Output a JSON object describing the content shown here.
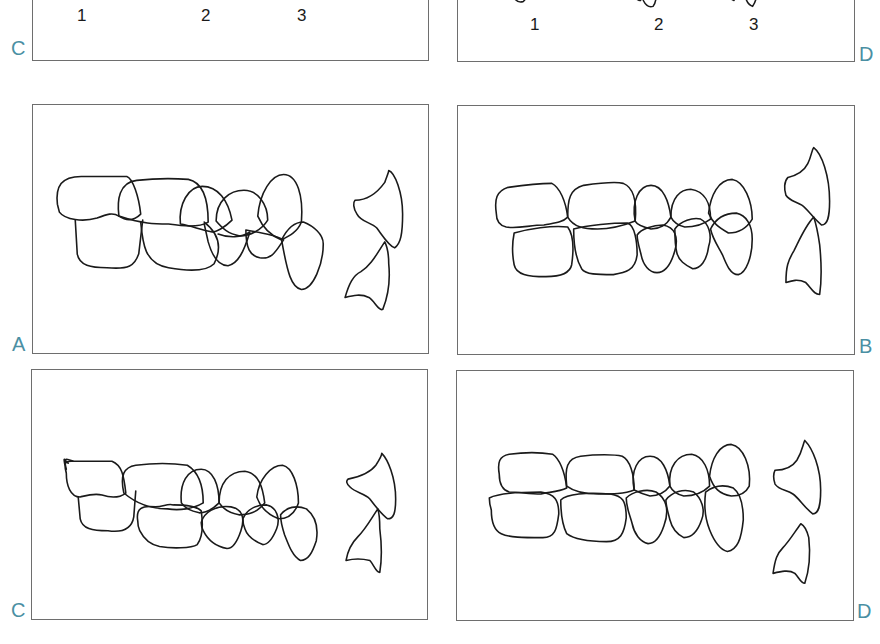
{
  "figure": {
    "label_color": "#4a8fa3",
    "line_color": "#1a1a1a",
    "frame_color": "#6e6e6e"
  },
  "top_partial_panels": [
    {
      "label": "C",
      "numerals": [
        "1",
        "2",
        "3"
      ]
    },
    {
      "label": "D",
      "numerals": [
        "1",
        "2",
        "3"
      ]
    }
  ],
  "panels": [
    {
      "id": "A",
      "label": "A",
      "description": "Lateral view of buccal occlusion with upper and lower incisors, upper arch positioned distally"
    },
    {
      "id": "B",
      "label": "B",
      "description": "Lateral view of occlusion with lower arch shifted mesially, incisors edge-to-edge"
    },
    {
      "id": "C",
      "label": "C",
      "description": "Lateral view of occlusion with lower molar shifted distally, incisors overlapping"
    },
    {
      "id": "D",
      "label": "D",
      "description": "Lateral view of cusp-to-cusp occlusion, incisors separated (open)"
    }
  ]
}
